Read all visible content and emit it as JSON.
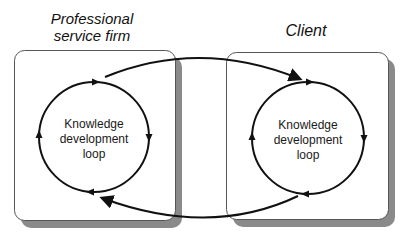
{
  "diagram": {
    "left_entity": {
      "title_line1": "Professional",
      "title_line2": "service firm",
      "loop": {
        "line1": "Knowledge",
        "line2": "development",
        "line3": "loop",
        "direction": "clockwise"
      }
    },
    "right_entity": {
      "title": "Client",
      "loop": {
        "line1": "Knowledge",
        "line2": "development",
        "line3": "loop",
        "direction": "clockwise"
      }
    },
    "connections": [
      {
        "from": "Professional service firm loop",
        "to": "Client loop",
        "position": "top"
      },
      {
        "from": "Client loop",
        "to": "Professional service firm loop",
        "position": "bottom"
      }
    ],
    "colors": {
      "stroke": "#111111",
      "box_border": "#555555",
      "shadow": "#8a8a8a",
      "background": "#ffffff"
    }
  }
}
